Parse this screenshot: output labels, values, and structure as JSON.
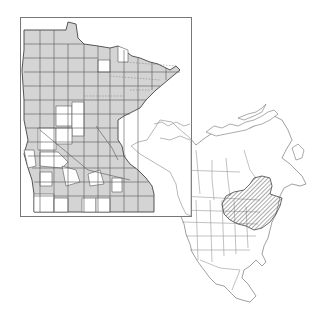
{
  "figure": {
    "type": "species-distribution-map",
    "panels": [
      {
        "id": "minnesota",
        "description": "Minnesota county map; shaded counties indicate recorded occurrence",
        "legend": {
          "present_fill": "#d4d4d4",
          "absent_fill": "#ffffff"
        }
      },
      {
        "id": "north-america",
        "description": "North America outline map with hatched native range in northeastern US and southeastern Canada",
        "range_pattern": "diagonal-hatch"
      }
    ]
  },
  "colors": {
    "background": "#ffffff",
    "frame_stroke": "#777777",
    "county_fill": "#d4d4d4",
    "county_stroke": "#555555",
    "outline_stroke": "#888888",
    "hatch_stroke": "#555555"
  }
}
